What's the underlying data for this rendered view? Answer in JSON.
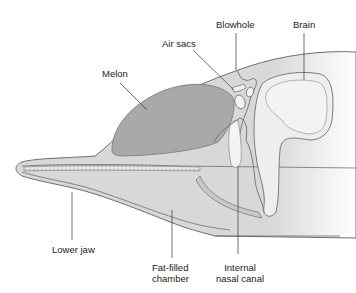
{
  "diagram": {
    "labels": {
      "melon": "Melon",
      "air_sacs": "Air sacs",
      "blowhole": "Blowhole",
      "brain": "Brain",
      "lower_jaw": "Lower jaw",
      "fat_chamber_line1": "Fat-filled",
      "fat_chamber_line2": "chamber",
      "nasal_canal_line1": "Internal",
      "nasal_canal_line2": "nasal canal"
    },
    "colors": {
      "background": "#ffffff",
      "tissue": "#dcdcdc",
      "melon": "#a9a9a9",
      "bone": "#ececec",
      "outline": "#6e6e6e",
      "leader_line": "#333333",
      "text": "#222222"
    }
  }
}
